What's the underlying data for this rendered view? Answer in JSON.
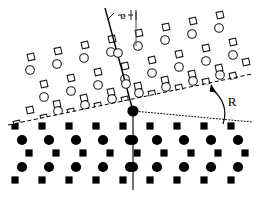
{
  "figure": {
    "canvas": {
      "width": 259,
      "height": 198,
      "background": "#ffffff"
    },
    "labels": {
      "tilt_angle": "ø",
      "rotation": "R"
    },
    "colors": {
      "ink": "#000000",
      "open_stroke": "#1a1a1a",
      "filled": "#000000",
      "guide": "#4d4d4d"
    },
    "geometry": {
      "origin": {
        "x": 133,
        "y": 111
      },
      "vertical_axis": {
        "x1": 133,
        "y1": 111,
        "x2": 133,
        "y2": 190
      },
      "tilted_axis": {
        "x1": 105,
        "y1": 8,
        "x2": 133,
        "y2": 111
      },
      "reference_vertical": {
        "x1": 136,
        "y1": 12,
        "x2": 136,
        "y2": 46
      },
      "dashed_interface": {
        "x1": 8,
        "y1": 125,
        "x2": 252,
        "y2": 74
      },
      "dotted_reference": {
        "x1": 133,
        "y1": 111,
        "x2": 252,
        "y2": 122
      },
      "rotation_arrow": {
        "tail_x": 223,
        "tail_y": 124,
        "head_x": 211,
        "head_y": 84
      }
    },
    "upper_lattice": {
      "description": "open symbols, rotated film",
      "symbols": [
        "open-circle",
        "open-square"
      ],
      "rotation_deg": -12
    },
    "lower_lattice": {
      "description": "filled symbols, substrate",
      "symbols": [
        "filled-circle",
        "filled-square"
      ],
      "rotation_deg": 0
    },
    "chart_data": {
      "type": "scatter",
      "title": "Rotated epitaxial interface lattice schematic",
      "xlabel": "",
      "ylabel": "",
      "xlim": [
        0,
        259
      ],
      "ylim": [
        198,
        0
      ],
      "grid": false,
      "legend": null,
      "annotations": [
        {
          "text": "ø",
          "x": 124,
          "y": 16,
          "meaning": "tilt angle of film axis from vertical"
        },
        {
          "text": "R",
          "x": 232,
          "y": 101,
          "meaning": "azimuthal rotation of film lattice"
        }
      ],
      "series": [
        {
          "name": "film-open-circles",
          "marker": "open-circle",
          "points": [
            [
              44,
              97
            ],
            [
              71,
              91
            ],
            [
              98,
              85
            ],
            [
              125,
              79
            ],
            [
              152,
              73
            ],
            [
              179,
              67
            ],
            [
              206,
              61
            ],
            [
              233,
              55
            ],
            [
              30,
              70
            ],
            [
              57,
              64
            ],
            [
              84,
              58
            ],
            [
              111,
              52
            ],
            [
              138,
              46
            ],
            [
              165,
              40
            ],
            [
              192,
              34
            ],
            [
              219,
              28
            ],
            [
              58,
              111
            ],
            [
              85,
              105
            ],
            [
              112,
              99
            ],
            [
              139,
              93
            ],
            [
              166,
              87
            ],
            [
              193,
              81
            ],
            [
              220,
              75
            ]
          ]
        },
        {
          "name": "film-open-squares",
          "marker": "open-square",
          "points": [
            [
              30,
              110
            ],
            [
              57,
              104
            ],
            [
              84,
              98
            ],
            [
              111,
              92
            ],
            [
              138,
              86
            ],
            [
              165,
              80
            ],
            [
              192,
              74
            ],
            [
              219,
              68
            ],
            [
              246,
              62
            ],
            [
              44,
              84
            ],
            [
              71,
              78
            ],
            [
              98,
              72
            ],
            [
              125,
              66
            ],
            [
              152,
              60
            ],
            [
              179,
              54
            ],
            [
              206,
              48
            ],
            [
              233,
              42
            ],
            [
              31,
              57
            ],
            [
              58,
              51
            ],
            [
              85,
              45
            ],
            [
              112,
              39
            ],
            [
              139,
              33
            ],
            [
              166,
              27
            ],
            [
              193,
              21
            ],
            [
              220,
              15
            ],
            [
              17,
              124
            ],
            [
              44,
              118
            ],
            [
              71,
              112
            ],
            [
              98,
              106
            ],
            [
              125,
              100
            ],
            [
              152,
              94
            ],
            [
              179,
              88
            ],
            [
              206,
              82
            ],
            [
              233,
              76
            ],
            [
              99,
              126
            ],
            [
              126,
              120
            ],
            [
              153,
              114
            ],
            [
              180,
              108
            ],
            [
              207,
              102
            ],
            [
              234,
              96
            ]
          ]
        },
        {
          "name": "substrate-filled-squares",
          "marker": "filled-square",
          "points": [
            [
              15,
              126
            ],
            [
              42,
              126
            ],
            [
              69,
              126
            ],
            [
              96,
              126
            ],
            [
              123,
              126
            ],
            [
              150,
              126
            ],
            [
              177,
              126
            ],
            [
              204,
              126
            ],
            [
              231,
              126
            ],
            [
              29,
              153
            ],
            [
              56,
              153
            ],
            [
              83,
              153
            ],
            [
              110,
              153
            ],
            [
              137,
              153
            ],
            [
              164,
              153
            ],
            [
              191,
              153
            ],
            [
              218,
              153
            ],
            [
              245,
              153
            ],
            [
              15,
              180
            ],
            [
              42,
              180
            ],
            [
              69,
              180
            ],
            [
              96,
              180
            ],
            [
              123,
              180
            ],
            [
              150,
              180
            ],
            [
              177,
              180
            ],
            [
              204,
              180
            ],
            [
              231,
              180
            ]
          ]
        },
        {
          "name": "substrate-filled-circles",
          "marker": "filled-circle",
          "points": [
            [
              22,
              140
            ],
            [
              49,
              140
            ],
            [
              76,
              140
            ],
            [
              103,
              140
            ],
            [
              130,
              140
            ],
            [
              157,
              140
            ],
            [
              184,
              140
            ],
            [
              211,
              140
            ],
            [
              238,
              140
            ],
            [
              22,
              167
            ],
            [
              49,
              167
            ],
            [
              76,
              167
            ],
            [
              103,
              167
            ],
            [
              130,
              167
            ],
            [
              157,
              167
            ],
            [
              184,
              167
            ],
            [
              211,
              167
            ],
            [
              238,
              167
            ]
          ]
        },
        {
          "name": "axis-open-circles",
          "marker": "open-circle-on-axis",
          "points": [
            [
              118,
              53
            ],
            [
              126,
              84
            ]
          ]
        },
        {
          "name": "origin-node",
          "marker": "filled-circle-large",
          "points": [
            [
              133,
              111
            ]
          ]
        },
        {
          "name": "axis-filled-circles",
          "marker": "filled-circle",
          "points": [
            [
              133,
              140
            ],
            [
              133,
              167
            ]
          ]
        }
      ]
    }
  }
}
